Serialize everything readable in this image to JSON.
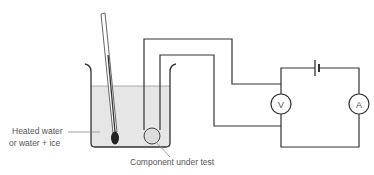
{
  "diagram": {
    "type": "circuit-experiment",
    "labels": {
      "water_line1": "Heated water",
      "water_line2": "or water + ice",
      "component": "Component under test"
    },
    "meters": {
      "voltmeter": "V",
      "ammeter": "A"
    },
    "colors": {
      "line": "#333333",
      "water": "#e6e6e6",
      "bulb": "#222222",
      "component_fill": "#dcdcdc",
      "label_text": "#555555"
    }
  }
}
